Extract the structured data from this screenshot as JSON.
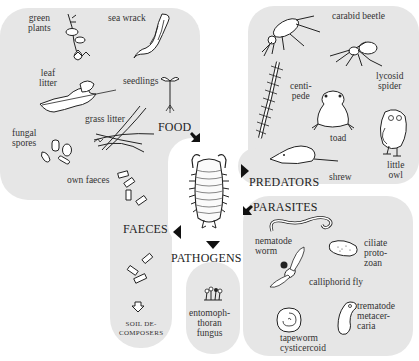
{
  "diagram": {
    "center": {
      "name": "woodlouse"
    },
    "colors": {
      "panel": "#e6e6e6",
      "background": "#ffffff",
      "ink": "#1e1e1e"
    },
    "food": {
      "heading": "FOOD",
      "items": {
        "green_plants": "green\nplants",
        "sea_wrack": "sea wrack",
        "leaf_litter": "leaf\nlitter",
        "seedlings": "seedlings",
        "grass_litter": "grass litter",
        "fungal_spores": "fungal\nspores",
        "own_faeces": "own faeces"
      }
    },
    "predators": {
      "heading": "PREDATORS",
      "items": {
        "carabid_beetle": "carabid beetle",
        "lycosid_spider": "lycosid\nspider",
        "centipede": "centi-\npede",
        "toad": "toad",
        "little_owl": "little\nowl",
        "shrew": "shrew"
      }
    },
    "faeces": {
      "heading": "FAECES",
      "soil_decomposers": "SOIL DE-\nCOMPOSERS"
    },
    "pathogens": {
      "heading": "PATHOGENS",
      "items": {
        "entomophthoran_fungus": "entomoph-\nthoran\nfungus"
      }
    },
    "parasites": {
      "heading": "PARASITES",
      "items": {
        "nematode_worm": "nematode\nworm",
        "ciliate_protozoan": "ciliate\nproto-\nzoan",
        "calliphorid_fly": "calliphorid fly",
        "trematode_metacercaria": "trematode\nmetacer-\ncaria",
        "tapeworm_cysticercoid": "tapeworm\ncysticercoid"
      }
    }
  }
}
